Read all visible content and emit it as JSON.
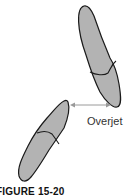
{
  "diagram": {
    "label": "Overjet",
    "caption": "FIGURE 15-20",
    "colors": {
      "tooth_fill": "#b3b3b3",
      "outline": "#1a1a1a",
      "arrow": "#9a9a9a"
    }
  }
}
